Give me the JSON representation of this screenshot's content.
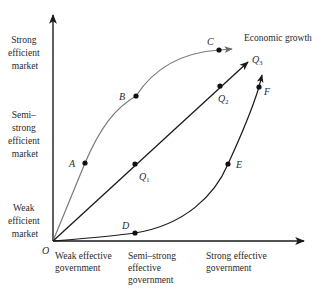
{
  "diagram": {
    "origin_label": "O",
    "y_axis": {
      "levels": [
        {
          "lines": [
            "Strong",
            "efficient",
            "market"
          ]
        },
        {
          "lines": [
            "Semi–",
            "strong",
            "efficient",
            "market"
          ]
        },
        {
          "lines": [
            "Weak",
            "efficient",
            "market"
          ]
        }
      ]
    },
    "x_axis": {
      "levels": [
        {
          "lines": [
            "Weak effective",
            "government"
          ]
        },
        {
          "lines": [
            "Semi–strong",
            "effective",
            "government"
          ]
        },
        {
          "lines": [
            "Strong effective",
            "government"
          ]
        }
      ]
    },
    "growth_label": "Economic growth",
    "curves": [
      {
        "name": "upper-curve",
        "points": [
          "A",
          "B",
          "C"
        ],
        "color": "#7a7a7a"
      },
      {
        "name": "diagonal-line",
        "points": [
          "Q1",
          "Q2",
          "Q3"
        ],
        "color": "#1a1a1a"
      },
      {
        "name": "lower-curve",
        "points": [
          "D",
          "E",
          "F"
        ],
        "color": "#1a1a1a"
      }
    ],
    "points": {
      "A": "A",
      "B": "B",
      "C": "C",
      "D": "D",
      "E": "E",
      "F": "F",
      "Q1": {
        "base": "Q",
        "sub": "1"
      },
      "Q2": {
        "base": "Q",
        "sub": "2"
      },
      "Q3": {
        "base": "Q",
        "sub": "3"
      }
    }
  }
}
